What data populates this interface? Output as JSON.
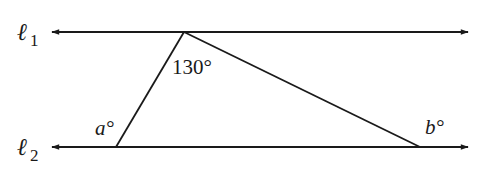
{
  "diagram": {
    "lines": [
      {
        "name": "l1",
        "symbol": "ℓ",
        "subscript": "1"
      },
      {
        "name": "l2",
        "symbol": "ℓ",
        "subscript": "2"
      }
    ],
    "angles": {
      "apex": "130°",
      "left": "a°",
      "right": "b°"
    },
    "colors": {
      "stroke": "#1a1a1a",
      "background": "#ffffff"
    }
  }
}
